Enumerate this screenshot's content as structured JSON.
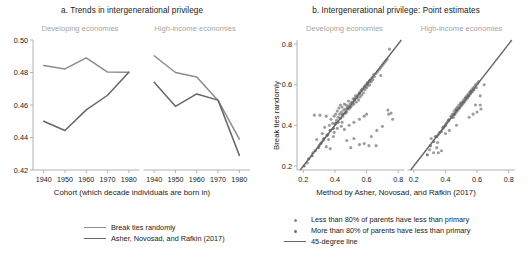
{
  "figure": {
    "clipped_top_title": "ergenerational privilege",
    "width": 528,
    "height": 268,
    "colors": {
      "series_light": "#8c8c8c",
      "series_dark": "#666666",
      "facet_label": "#a6a6a6",
      "axis": "#b3b3b3",
      "text": "#1a1a1a",
      "dot_light": "#8c8c8c",
      "dot_dark": "#6b6b6b"
    }
  },
  "panel_a": {
    "title": "a. Trends in intergenerational privilege",
    "facets": [
      "Developing economies",
      "High-income economies"
    ],
    "xlabel": "Cohort (which decade individuals are born in)",
    "legend": [
      {
        "label": "Break ties randomly",
        "marker": "line",
        "color": "#8c8c8c"
      },
      {
        "label": "Asher, Novosad, and Rafkin (2017)",
        "marker": "line",
        "color": "#666666"
      }
    ]
  },
  "panel_b": {
    "title": "b. Intergenerational privilege: Point estimates",
    "facets": [
      "Developing economies",
      "High-income economies"
    ],
    "xlabel": "Method by Asher, Novosad, and Rafkin (2017)",
    "ylabel": "Break ties randomly",
    "legend": [
      {
        "label": "Less than 80% of parents have less than primary",
        "marker": "dot",
        "color": "#8c8c8c"
      },
      {
        "label": "More than 80% of parents have less than primary",
        "marker": "dot",
        "color": "#6b6b6b"
      },
      {
        "label": "45-degree line",
        "marker": "line",
        "color": "#666666"
      }
    ]
  },
  "chart_data": [
    {
      "id": "panel-a",
      "type": "line",
      "title": "a. Trends in intergenerational privilege",
      "xlabel": "Cohort (which decade individuals are born in)",
      "ylabel": "",
      "ylim": [
        0.42,
        0.5
      ],
      "yticks": [
        0.42,
        0.44,
        0.46,
        0.48,
        0.5
      ],
      "ytick_labels": [
        "0.42",
        "0.44",
        "0.46",
        "0.48",
        "0.50"
      ],
      "xlim": [
        1935,
        1985
      ],
      "xticks": [
        1940,
        1950,
        1960,
        1970,
        1980
      ],
      "xtick_labels": [
        "1940",
        "1950",
        "1960",
        "1970",
        "1980"
      ],
      "grid": false,
      "legend_position": "below-center",
      "facets": [
        {
          "name": "Developing economies",
          "x": [
            1940,
            1950,
            1960,
            1970,
            1980
          ],
          "series": [
            {
              "name": "Break ties randomly",
              "color": "#8c8c8c",
              "values": [
                0.4843,
                0.4822,
                0.489,
                0.4803,
                0.4802
              ]
            },
            {
              "name": "Asher, Novosad, and Rafkin (2017)",
              "color": "#666666",
              "values": [
                0.45,
                0.4443,
                0.457,
                0.466,
                0.4802
              ]
            }
          ]
        },
        {
          "name": "High-income economies",
          "x": [
            1940,
            1950,
            1960,
            1970,
            1980
          ],
          "series": [
            {
              "name": "Break ties randomly",
              "color": "#8c8c8c",
              "values": [
                0.4903,
                0.48,
                0.4772,
                0.4628,
                0.439
              ]
            },
            {
              "name": "Asher, Novosad, and Rafkin (2017)",
              "color": "#666666",
              "values": [
                0.474,
                0.4592,
                0.4668,
                0.463,
                0.429
              ]
            }
          ]
        }
      ]
    },
    {
      "id": "panel-b",
      "type": "scatter",
      "title": "b. Intergenerational privilege: Point estimates",
      "xlabel": "Method by Asher, Novosad, and Rafkin (2017)",
      "ylabel": "Break ties randomly",
      "xlim": [
        0.16,
        0.84
      ],
      "ylim": [
        0.18,
        0.82
      ],
      "xticks": [
        0.2,
        0.4,
        0.6,
        0.8
      ],
      "xtick_labels": [
        "0.2",
        "0.4",
        "0.6",
        "0.8"
      ],
      "yticks": [
        0.2,
        0.4,
        0.6,
        0.8
      ],
      "ytick_labels": [
        "0.2",
        "0.4",
        "0.6",
        "0.8"
      ],
      "grid": false,
      "reference_line": {
        "name": "45-degree line",
        "slope": 1,
        "intercept": 0,
        "color": "#666666"
      },
      "legend_position": "below-right",
      "facets": [
        {
          "name": "Developing economies",
          "points_group_light": [
            [
              0.26,
              0.265
            ],
            [
              0.225,
              0.215
            ],
            [
              0.3,
              0.3
            ],
            [
              0.315,
              0.315
            ],
            [
              0.285,
              0.33
            ],
            [
              0.27,
              0.45
            ],
            [
              0.305,
              0.45
            ],
            [
              0.345,
              0.445
            ],
            [
              0.335,
              0.39
            ],
            [
              0.32,
              0.36
            ],
            [
              0.355,
              0.355
            ],
            [
              0.365,
              0.4
            ],
            [
              0.375,
              0.43
            ],
            [
              0.385,
              0.41
            ],
            [
              0.395,
              0.445
            ],
            [
              0.4,
              0.405
            ],
            [
              0.405,
              0.455
            ],
            [
              0.41,
              0.425
            ],
            [
              0.415,
              0.47
            ],
            [
              0.42,
              0.44
            ],
            [
              0.425,
              0.485
            ],
            [
              0.43,
              0.455
            ],
            [
              0.435,
              0.5
            ],
            [
              0.44,
              0.465
            ],
            [
              0.445,
              0.49
            ],
            [
              0.45,
              0.445
            ],
            [
              0.455,
              0.475
            ],
            [
              0.46,
              0.505
            ],
            [
              0.465,
              0.48
            ],
            [
              0.47,
              0.5
            ],
            [
              0.475,
              0.465
            ],
            [
              0.48,
              0.495
            ],
            [
              0.485,
              0.52
            ],
            [
              0.49,
              0.48
            ],
            [
              0.495,
              0.505
            ],
            [
              0.5,
              0.49
            ],
            [
              0.505,
              0.515
            ],
            [
              0.51,
              0.5
            ],
            [
              0.515,
              0.53
            ],
            [
              0.52,
              0.505
            ],
            [
              0.525,
              0.52
            ],
            [
              0.53,
              0.545
            ],
            [
              0.535,
              0.515
            ],
            [
              0.54,
              0.535
            ],
            [
              0.545,
              0.55
            ],
            [
              0.55,
              0.525
            ],
            [
              0.555,
              0.555
            ],
            [
              0.56,
              0.54
            ],
            [
              0.565,
              0.57
            ],
            [
              0.57,
              0.55
            ],
            [
              0.575,
              0.58
            ],
            [
              0.58,
              0.56
            ],
            [
              0.585,
              0.59
            ],
            [
              0.59,
              0.575
            ],
            [
              0.595,
              0.6
            ],
            [
              0.6,
              0.585
            ],
            [
              0.605,
              0.61
            ],
            [
              0.61,
              0.595
            ],
            [
              0.615,
              0.615
            ],
            [
              0.62,
              0.6
            ],
            [
              0.625,
              0.625
            ],
            [
              0.63,
              0.615
            ],
            [
              0.635,
              0.635
            ],
            [
              0.64,
              0.625
            ],
            [
              0.645,
              0.65
            ],
            [
              0.65,
              0.64
            ],
            [
              0.66,
              0.655
            ],
            [
              0.67,
              0.665
            ],
            [
              0.68,
              0.675
            ],
            [
              0.69,
              0.685
            ],
            [
              0.7,
              0.695
            ],
            [
              0.71,
              0.705
            ],
            [
              0.72,
              0.715
            ],
            [
              0.73,
              0.725
            ],
            [
              0.745,
              0.775
            ],
            [
              0.69,
              0.645
            ],
            [
              0.735,
              0.475
            ],
            [
              0.74,
              0.455
            ],
            [
              0.755,
              0.46
            ],
            [
              0.765,
              0.43
            ],
            [
              0.615,
              0.3
            ],
            [
              0.66,
              0.3
            ],
            [
              0.585,
              0.31
            ],
            [
              0.555,
              0.305
            ],
            [
              0.5,
              0.29
            ],
            [
              0.475,
              0.325
            ],
            [
              0.52,
              0.335
            ],
            [
              0.63,
              0.345
            ],
            [
              0.665,
              0.375
            ],
            [
              0.7,
              0.395
            ],
            [
              0.36,
              0.33
            ],
            [
              0.39,
              0.345
            ],
            [
              0.325,
              0.325
            ],
            [
              0.345,
              0.295
            ],
            [
              0.37,
              0.285
            ],
            [
              0.44,
              0.395
            ],
            [
              0.46,
              0.38
            ],
            [
              0.49,
              0.4
            ],
            [
              0.52,
              0.415
            ],
            [
              0.555,
              0.43
            ],
            [
              0.585,
              0.445
            ],
            [
              0.6,
              0.455
            ],
            [
              0.445,
              0.415
            ],
            [
              0.415,
              0.385
            ],
            [
              0.395,
              0.365
            ]
          ],
          "points_group_dark": [
            [
              0.205,
              0.2
            ],
            [
              0.235,
              0.235
            ],
            [
              0.255,
              0.25
            ],
            [
              0.275,
              0.275
            ],
            [
              0.295,
              0.29
            ],
            [
              0.31,
              0.31
            ],
            [
              0.33,
              0.335
            ],
            [
              0.35,
              0.35
            ],
            [
              0.37,
              0.375
            ],
            [
              0.39,
              0.385
            ],
            [
              0.405,
              0.41
            ],
            [
              0.42,
              0.415
            ],
            [
              0.435,
              0.435
            ],
            [
              0.45,
              0.455
            ],
            [
              0.465,
              0.46
            ],
            [
              0.48,
              0.485
            ],
            [
              0.495,
              0.49
            ],
            [
              0.51,
              0.51
            ],
            [
              0.525,
              0.53
            ],
            [
              0.54,
              0.54
            ],
            [
              0.555,
              0.56
            ],
            [
              0.57,
              0.575
            ],
            [
              0.59,
              0.59
            ],
            [
              0.605,
              0.605
            ],
            [
              0.62,
              0.62
            ]
          ]
        },
        {
          "name": "High-income economies",
          "points_group_light": [
            [
              0.3,
              0.28
            ],
            [
              0.325,
              0.265
            ],
            [
              0.345,
              0.29
            ],
            [
              0.355,
              0.265
            ],
            [
              0.375,
              0.275
            ],
            [
              0.31,
              0.335
            ],
            [
              0.335,
              0.345
            ],
            [
              0.355,
              0.355
            ],
            [
              0.375,
              0.37
            ],
            [
              0.385,
              0.385
            ],
            [
              0.395,
              0.395
            ],
            [
              0.405,
              0.41
            ],
            [
              0.415,
              0.42
            ],
            [
              0.425,
              0.43
            ],
            [
              0.435,
              0.445
            ],
            [
              0.445,
              0.455
            ],
            [
              0.45,
              0.44
            ],
            [
              0.455,
              0.47
            ],
            [
              0.46,
              0.455
            ],
            [
              0.465,
              0.48
            ],
            [
              0.47,
              0.465
            ],
            [
              0.475,
              0.49
            ],
            [
              0.48,
              0.475
            ],
            [
              0.485,
              0.5
            ],
            [
              0.49,
              0.485
            ],
            [
              0.495,
              0.51
            ],
            [
              0.5,
              0.495
            ],
            [
              0.505,
              0.515
            ],
            [
              0.51,
              0.505
            ],
            [
              0.515,
              0.525
            ],
            [
              0.52,
              0.515
            ],
            [
              0.525,
              0.535
            ],
            [
              0.53,
              0.525
            ],
            [
              0.535,
              0.545
            ],
            [
              0.54,
              0.535
            ],
            [
              0.545,
              0.555
            ],
            [
              0.55,
              0.545
            ],
            [
              0.555,
              0.565
            ],
            [
              0.56,
              0.555
            ],
            [
              0.565,
              0.575
            ],
            [
              0.57,
              0.565
            ],
            [
              0.575,
              0.585
            ],
            [
              0.58,
              0.575
            ],
            [
              0.585,
              0.59
            ],
            [
              0.59,
              0.6
            ],
            [
              0.595,
              0.585
            ],
            [
              0.6,
              0.605
            ],
            [
              0.61,
              0.615
            ],
            [
              0.62,
              0.5
            ],
            [
              0.625,
              0.48
            ],
            [
              0.6,
              0.465
            ],
            [
              0.575,
              0.455
            ],
            [
              0.59,
              0.5
            ],
            [
              0.62,
              0.545
            ],
            [
              0.645,
              0.6
            ],
            [
              0.55,
              0.44
            ],
            [
              0.47,
              0.4
            ],
            [
              0.425,
              0.375
            ],
            [
              0.4,
              0.36
            ],
            [
              0.35,
              0.315
            ]
          ],
          "points_group_dark": [
            [
              0.285,
              0.255
            ],
            [
              0.305,
              0.3
            ],
            [
              0.325,
              0.32
            ],
            [
              0.345,
              0.345
            ],
            [
              0.365,
              0.365
            ],
            [
              0.385,
              0.39
            ],
            [
              0.4,
              0.4
            ],
            [
              0.42,
              0.425
            ],
            [
              0.44,
              0.44
            ],
            [
              0.455,
              0.455
            ],
            [
              0.47,
              0.475
            ],
            [
              0.485,
              0.485
            ],
            [
              0.5,
              0.505
            ],
            [
              0.515,
              0.515
            ],
            [
              0.53,
              0.535
            ],
            [
              0.545,
              0.545
            ],
            [
              0.56,
              0.565
            ],
            [
              0.575,
              0.575
            ]
          ]
        }
      ]
    }
  ]
}
